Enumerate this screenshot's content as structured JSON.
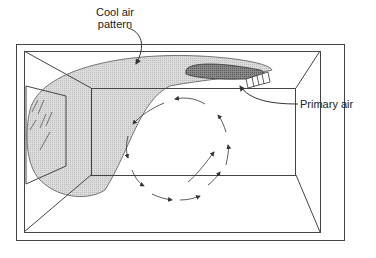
{
  "diagram": {
    "labels": {
      "cool_air": [
        "Cool air",
        "pattern"
      ],
      "primary_air": "Primary air"
    },
    "colors": {
      "line": "#333333",
      "cool_air_fill": "#d6d6d6",
      "primary_air_fill": "#7a7a7a"
    }
  }
}
